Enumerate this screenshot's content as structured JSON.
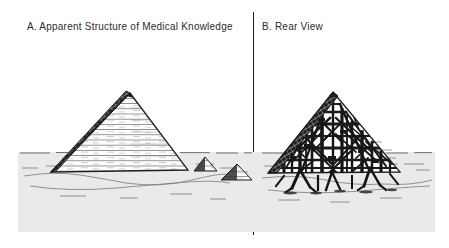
{
  "figure": {
    "kind": "two-panel-line-drawing",
    "background_color": "#ffffff",
    "ink_color": "#1d1d1d",
    "sand_color": "#e9e9e9",
    "divider": {
      "name": "panel-divider",
      "orientation": "vertical",
      "color": "#1d1d1d"
    }
  },
  "panels": [
    {
      "id": "A",
      "caption": "A. Apparent Structure of Medical Knowledge",
      "subject": "large solid stone pyramid with two small background pyramids on desert sand",
      "pyramid": {
        "appearance": "solid",
        "left_face": "dark stepped stone blocks",
        "right_face": "light horizontal masonry hatching",
        "apex": {
          "x": 130,
          "y": 93
        },
        "base_left": {
          "x": 52,
          "y": 172
        },
        "base_right": {
          "x": 188,
          "y": 170
        }
      },
      "background_pyramids": [
        {
          "apex": {
            "x": 205,
            "y": 157
          },
          "base_left": {
            "x": 194,
            "y": 171
          },
          "base_right": {
            "x": 217,
            "y": 171
          }
        },
        {
          "apex": {
            "x": 237,
            "y": 164
          },
          "base_left": {
            "x": 221,
            "y": 180
          },
          "base_right": {
            "x": 252,
            "y": 180
          }
        }
      ]
    },
    {
      "id": "B",
      "caption": "B. Rear View",
      "subject": "same pyramid seen from behind: only a thin stone shell, propped up by chaotic wooden scaffolding",
      "pyramid": {
        "appearance": "hollow shell with scaffolding",
        "left_face": "thin stepped stone facade",
        "interior": "crisscrossed timber beams, posts, braces and props",
        "apex": {
          "x": 333,
          "y": 92
        },
        "base_left": {
          "x": 268,
          "y": 173
        },
        "base_right": {
          "x": 400,
          "y": 172
        }
      },
      "scaffold": {
        "vertical_posts": 14,
        "diagonal_braces": 26,
        "ground_props": 7
      }
    }
  ]
}
